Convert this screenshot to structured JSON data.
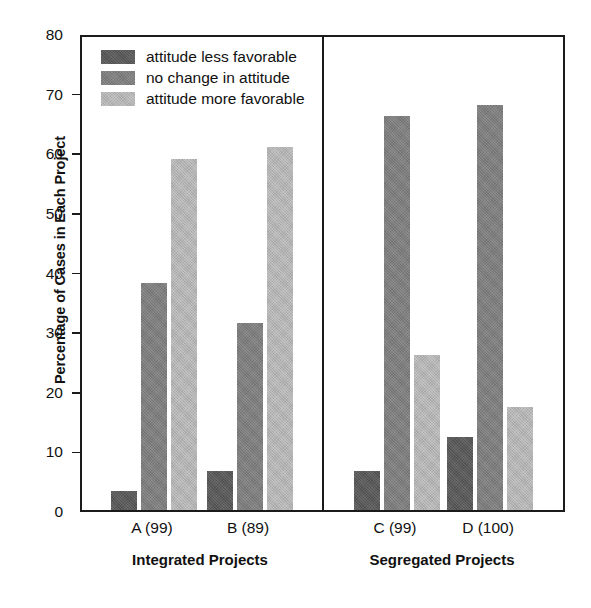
{
  "chart_data": {
    "type": "bar",
    "title": "",
    "xlabel": "",
    "ylabel": "Percentage of Cases in Each Project",
    "ylim": [
      0,
      80
    ],
    "yticks": [
      0,
      10,
      20,
      30,
      40,
      50,
      60,
      70,
      80
    ],
    "grid": false,
    "legend_position": "top-left",
    "categories": [
      "A (99)",
      "B (89)",
      "C (99)",
      "D (100)"
    ],
    "groups": [
      {
        "name": "Integrated Projects",
        "categories": [
          "A (99)",
          "B (89)"
        ]
      },
      {
        "name": "Segregated Projects",
        "categories": [
          "C (99)",
          "D (100)"
        ]
      }
    ],
    "series": [
      {
        "name": "attitude less favorable",
        "color": "#595959",
        "values": [
          3.2,
          6.5,
          6.5,
          12.3
        ]
      },
      {
        "name": "no change in attitude",
        "color": "#7d7d7d",
        "values": [
          38.0,
          31.3,
          66.0,
          68.0
        ]
      },
      {
        "name": "attitude more favorable",
        "color": "#b4b4b4",
        "values": [
          58.8,
          60.8,
          26.0,
          17.2
        ]
      }
    ]
  },
  "axis": {
    "y_title": "Percentage of Cases in Each Project",
    "y_tick_labels": [
      "0",
      "10",
      "20",
      "30",
      "40",
      "50",
      "60",
      "70",
      "80"
    ],
    "x_tick_labels": [
      "A (99)",
      "B (89)",
      "C (99)",
      "D (100)"
    ],
    "group_labels": [
      "Integrated Projects",
      "Segregated Projects"
    ]
  },
  "legend": {
    "items": [
      {
        "label": "attitude less favorable",
        "swatch": "#595959"
      },
      {
        "label": "no change in attitude",
        "swatch": "#7d7d7d"
      },
      {
        "label": "attitude more favorable",
        "swatch": "#b4b4b4"
      }
    ]
  }
}
